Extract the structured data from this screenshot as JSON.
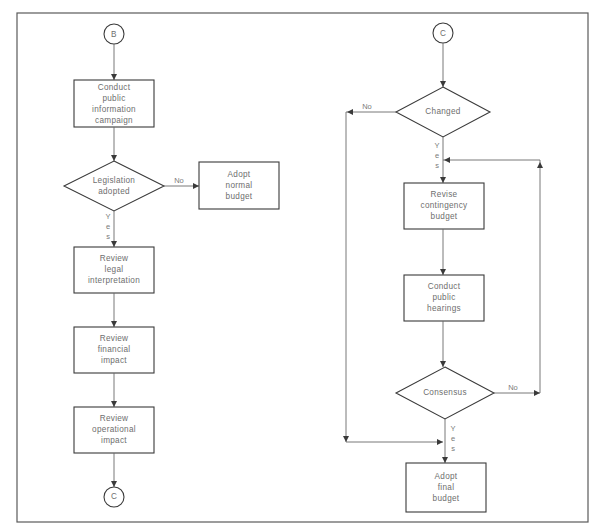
{
  "diagram": {
    "type": "flowchart",
    "frame": {
      "x": 17,
      "y": 13,
      "w": 571,
      "h": 509
    },
    "colors": {
      "stroke": "#3a3a3a",
      "line": "#6a6a6a",
      "text": "#6e6e6e",
      "background": "#ffffff"
    },
    "left_flow": {
      "start_connector": {
        "label": "B",
        "cx": 114,
        "cy": 34,
        "r": 10
      },
      "nodes": [
        {
          "id": "conduct-campaign",
          "kind": "process",
          "label": "Conduct\npublic\ninformation\ncampaign",
          "x": 74,
          "y": 80,
          "w": 80,
          "h": 47
        },
        {
          "id": "legislation-adopted",
          "kind": "decision",
          "label": "Legislation\nadopted",
          "cx": 114,
          "cy": 186,
          "hw": 50,
          "hh": 25
        },
        {
          "id": "adopt-normal-budget",
          "kind": "process",
          "label": "Adopt\nnormal\nbudget",
          "x": 199,
          "y": 162,
          "w": 80,
          "h": 47
        },
        {
          "id": "review-legal",
          "kind": "process",
          "label": "Review\nlegal\ninterpretation",
          "x": 74,
          "y": 247,
          "w": 80,
          "h": 46
        },
        {
          "id": "review-financial",
          "kind": "process",
          "label": "Review\nfinancial\nimpact",
          "x": 74,
          "y": 327,
          "w": 80,
          "h": 46
        },
        {
          "id": "review-operational",
          "kind": "process",
          "label": "Review\noperational\nimpact",
          "x": 74,
          "y": 407,
          "w": 80,
          "h": 46
        }
      ],
      "end_connector": {
        "label": "C",
        "cx": 114,
        "cy": 497,
        "r": 10
      },
      "edge_labels": {
        "no": "No",
        "yes": "Y\ne\ns"
      }
    },
    "right_flow": {
      "start_connector": {
        "label": "C",
        "cx": 443,
        "cy": 33,
        "r": 10
      },
      "nodes": [
        {
          "id": "changed",
          "kind": "decision",
          "label": "Changed",
          "cx": 443,
          "cy": 112,
          "hw": 47,
          "hh": 25
        },
        {
          "id": "revise-contingency",
          "kind": "process",
          "label": "Revise\ncontingency\nbudget",
          "x": 404,
          "y": 183,
          "w": 80,
          "h": 46
        },
        {
          "id": "conduct-hearings",
          "kind": "process",
          "label": "Conduct\npublic\nhearings",
          "x": 404,
          "y": 275,
          "w": 80,
          "h": 46
        },
        {
          "id": "consensus",
          "kind": "decision",
          "label": "Consensus",
          "cx": 445,
          "cy": 393,
          "hw": 49,
          "hh": 26
        },
        {
          "id": "adopt-final-budget",
          "kind": "process",
          "label": "Adopt\nfinal\nbudget",
          "x": 406,
          "y": 463,
          "w": 80,
          "h": 49
        }
      ],
      "edge_labels": {
        "changed_no": "No",
        "changed_yes": "Y\ne\ns",
        "consensus_no": "No",
        "consensus_yes": "Y\ne\ns"
      }
    }
  }
}
